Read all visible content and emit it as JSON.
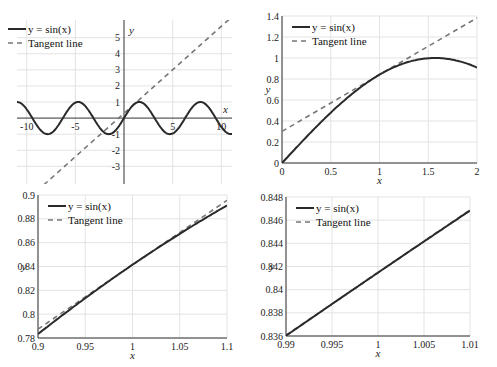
{
  "legend": {
    "sin_label": "y = sin(x)",
    "tangent_label": "Tangent line"
  },
  "colors": {
    "sin_line": "#2a2a2a",
    "tangent_line": "#777777",
    "grid": "#e3e3e3"
  },
  "chart_data": [
    {
      "type": "line",
      "title": "",
      "xlabel": "x",
      "ylabel": "y",
      "xlim": [
        -11,
        11.1
      ],
      "ylim": [
        -4.1,
        6.1
      ],
      "xticks": [
        "-10",
        "-5",
        "5",
        "10"
      ],
      "yticks": [
        "5",
        "4",
        "3",
        "2",
        "1",
        "-1",
        "-2",
        "-3"
      ],
      "grid": true,
      "axes_style": "centered at origin",
      "legend_position": "upper left",
      "series": [
        {
          "name": "y = sin(x)",
          "style": "solid",
          "function": "sin(x)",
          "x_range": [
            -11,
            11.1
          ]
        },
        {
          "name": "Tangent line",
          "style": "dashed",
          "function": "sin(1) + cos(1)(x-1)",
          "x_points": [
            -9.0,
            10.8
          ],
          "y_points": [
            -4.1,
            6.1
          ]
        }
      ]
    },
    {
      "type": "line",
      "title": "",
      "xlabel": "x",
      "ylabel": "y",
      "xlim": [
        0,
        2
      ],
      "ylim": [
        0,
        1.4
      ],
      "xticks": [
        "0",
        "0.5",
        "1",
        "1.5",
        "2"
      ],
      "yticks": [
        "0",
        "0.2",
        "0.4",
        "0.6",
        "0.8",
        "1",
        "1.2",
        "1.4"
      ],
      "grid": true,
      "legend_position": "upper left",
      "series": [
        {
          "name": "y = sin(x)",
          "style": "solid",
          "x": [
            0,
            0.5,
            1,
            1.5,
            2
          ],
          "values": [
            0,
            0.479,
            0.841,
            0.997,
            0.909
          ]
        },
        {
          "name": "Tangent line",
          "style": "dashed",
          "x": [
            0,
            2
          ],
          "values": [
            0.301,
            1.382
          ]
        }
      ]
    },
    {
      "type": "line",
      "title": "",
      "xlabel": "x",
      "ylabel": "y",
      "xlim": [
        0.9,
        1.1
      ],
      "ylim": [
        0.78,
        0.9
      ],
      "xticks": [
        "0.9",
        "0.95",
        "1",
        "1.05",
        "1.1"
      ],
      "yticks": [
        "0.78",
        "0.8",
        "0.82",
        "0.84",
        "0.86",
        "0.88",
        "0.9"
      ],
      "grid": true,
      "legend_position": "upper left",
      "series": [
        {
          "name": "y = sin(x)",
          "style": "solid",
          "x": [
            0.9,
            0.95,
            1,
            1.05,
            1.1
          ],
          "values": [
            0.783,
            0.813,
            0.841,
            0.867,
            0.891
          ]
        },
        {
          "name": "Tangent line",
          "style": "dashed",
          "x": [
            0.9,
            1.1
          ],
          "values": [
            0.787,
            0.896
          ]
        }
      ]
    },
    {
      "type": "line",
      "title": "",
      "xlabel": "x",
      "ylabel": "y",
      "xlim": [
        0.99,
        1.01
      ],
      "ylim": [
        0.836,
        0.848
      ],
      "xticks": [
        "0.99",
        "0.995",
        "1",
        "1.005",
        "1.01"
      ],
      "yticks": [
        "0.836",
        "0.838",
        "0.84",
        "0.842",
        "0.844",
        "0.846",
        "0.848"
      ],
      "grid": true,
      "legend_position": "upper left",
      "series": [
        {
          "name": "y = sin(x)",
          "style": "solid",
          "x": [
            0.99,
            1.0,
            1.01
          ],
          "values": [
            0.836,
            0.8415,
            0.8468
          ]
        },
        {
          "name": "Tangent line",
          "style": "dashed",
          "x": [
            0.99,
            1.01
          ],
          "values": [
            0.8361,
            0.8469
          ]
        }
      ]
    }
  ]
}
